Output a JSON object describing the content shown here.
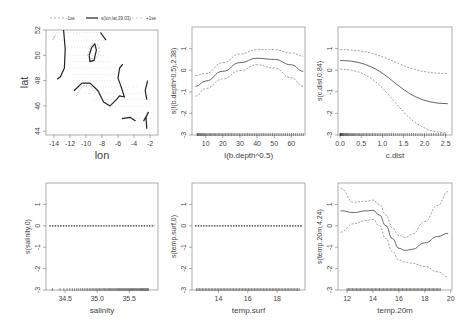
{
  "figure": {
    "layout": "2x3 grid of GAM partial-effect plots",
    "colors": {
      "fit": "#555555",
      "se": "#888888",
      "rug": "#222222",
      "frame": "#999999",
      "grid_points": "#aaaaaa"
    }
  },
  "chart_data": [
    {
      "type": "contour",
      "id": "lonlat",
      "title": "",
      "legend": [
        "-1se",
        "s(lon,lat,39.03)",
        "+1se"
      ],
      "xlabel": "lon",
      "ylabel": "lat",
      "xlim": [
        -15,
        -1
      ],
      "ylim": [
        43.7,
        52
      ],
      "xticks": [
        -14,
        -12,
        -10,
        -8,
        -6,
        -4,
        -2
      ],
      "yticks": [
        44,
        46,
        48,
        50,
        52
      ],
      "contours": [
        {
          "style": "solid",
          "points": [
            [
              -12.8,
              52
            ],
            [
              -12.6,
              50.5
            ],
            [
              -12.7,
              49
            ],
            [
              -13.2,
              48.3
            ],
            [
              -13.6,
              48.1
            ]
          ]
        },
        {
          "style": "solid",
          "points": [
            [
              -9.6,
              50.0
            ],
            [
              -9.3,
              50.6
            ],
            [
              -8.9,
              50.9
            ],
            [
              -8.7,
              50.4
            ],
            [
              -9.0,
              49.6
            ],
            [
              -9.5,
              49.5
            ],
            [
              -9.6,
              50.0
            ]
          ]
        },
        {
          "style": "solid",
          "points": [
            [
              -8.2,
              51.8
            ],
            [
              -7.5,
              51.2
            ]
          ]
        },
        {
          "style": "solid",
          "points": [
            [
              -11.5,
              47.2
            ],
            [
              -10.5,
              47.8
            ],
            [
              -9.5,
              47.8
            ],
            [
              -8.5,
              47.2
            ],
            [
              -7.8,
              46.3
            ],
            [
              -7,
              46.0
            ],
            [
              -6.2,
              46.5
            ],
            [
              -5.8,
              46.8
            ],
            [
              -5.2,
              46.7
            ],
            [
              -5.6,
              47.5
            ],
            [
              -6.0,
              48.2
            ],
            [
              -5.8,
              49.0
            ],
            [
              -5.4,
              49.3
            ]
          ]
        },
        {
          "style": "solid",
          "points": [
            [
              -2.3,
              48.0
            ],
            [
              -2.6,
              47.2
            ],
            [
              -2.4,
              46.5
            ]
          ]
        },
        {
          "style": "solid",
          "points": [
            [
              -5.5,
              45.0
            ],
            [
              -4.5,
              45.1
            ],
            [
              -3.8,
              44.8
            ]
          ]
        },
        {
          "style": "solid",
          "points": [
            [
              -2.8,
              44.8
            ],
            [
              -2.2,
              45.5
            ],
            [
              -2.5,
              45.1
            ],
            [
              -2.4,
              44.2
            ]
          ]
        }
      ]
    },
    {
      "type": "line",
      "id": "bdepth",
      "xlabel": "I(b.depth^0.5)",
      "ylabel": "s(I(b.depth^0.5),2.38)",
      "xlim": [
        2,
        68
      ],
      "ylim": [
        -3,
        2
      ],
      "xticks": [
        10,
        20,
        30,
        40,
        50,
        60
      ],
      "yticks": [
        -3,
        -2,
        -1,
        0,
        1
      ],
      "x": [
        4,
        10,
        20,
        30,
        40,
        50,
        60,
        67
      ],
      "series": [
        {
          "name": "fit",
          "values": [
            -0.75,
            -0.5,
            -0.05,
            0.35,
            0.55,
            0.5,
            0.25,
            -0.05
          ]
        },
        {
          "name": "upper",
          "values": [
            -0.25,
            -0.15,
            0.35,
            0.75,
            0.95,
            0.95,
            0.8,
            0.65
          ]
        },
        {
          "name": "lower",
          "values": [
            -1.2,
            -0.85,
            -0.4,
            -0.02,
            0.25,
            0.1,
            -0.35,
            -0.75
          ]
        }
      ]
    },
    {
      "type": "line",
      "id": "cdist",
      "xlabel": "c.dist",
      "ylabel": "s(c.dist,0.84)",
      "xlim": [
        -0.05,
        2.65
      ],
      "ylim": [
        -3,
        2
      ],
      "xticks": [
        0.0,
        0.5,
        1.0,
        1.5,
        2.0,
        2.5
      ],
      "yticks": [
        -3,
        -2,
        -1,
        0,
        1
      ],
      "x": [
        0.0,
        2.55
      ],
      "series": [
        {
          "name": "fit",
          "values": [
            0.45,
            -1.55
          ]
        },
        {
          "name": "upper",
          "values": [
            0.95,
            -0.15
          ]
        },
        {
          "name": "lower",
          "values": [
            0.05,
            -2.9
          ]
        }
      ]
    },
    {
      "type": "line",
      "id": "salinity",
      "xlabel": "salinity",
      "ylabel": "s(salinity,0)",
      "xlim": [
        34.2,
        35.95
      ],
      "ylim": [
        -3,
        2
      ],
      "xticks": [
        34.5,
        35.0,
        35.5
      ],
      "yticks": [
        -3,
        -2,
        -1,
        0,
        1
      ],
      "x": [
        34.25,
        35.9
      ],
      "series": [
        {
          "name": "fit",
          "values": [
            0,
            0
          ]
        }
      ]
    },
    {
      "type": "line",
      "id": "tempsurf",
      "xlabel": "temp.surf",
      "ylabel": "s(temp.surf,0)",
      "xlim": [
        12.2,
        19.9
      ],
      "ylim": [
        -3,
        2
      ],
      "xticks": [
        14,
        16,
        18
      ],
      "yticks": [
        -3,
        -2,
        -1,
        0,
        1
      ],
      "x": [
        12.4,
        19.7
      ],
      "series": [
        {
          "name": "fit",
          "values": [
            0,
            0
          ]
        }
      ]
    },
    {
      "type": "line",
      "id": "temp20m",
      "xlabel": "temp.20m",
      "ylabel": "s(temp.20m,4.24)",
      "xlim": [
        11.3,
        20.1
      ],
      "ylim": [
        -3,
        2
      ],
      "xticks": [
        12,
        14,
        16,
        18,
        20
      ],
      "yticks": [
        -3,
        -2,
        -1,
        0,
        1
      ],
      "x": [
        11.5,
        12.5,
        13.5,
        14.0,
        14.5,
        15.0,
        15.5,
        16.0,
        16.5,
        17.0,
        18.0,
        19.0,
        19.8
      ],
      "series": [
        {
          "name": "fit",
          "values": [
            0.7,
            0.62,
            0.7,
            0.72,
            0.5,
            0.0,
            -0.6,
            -1.05,
            -1.15,
            -1.1,
            -0.8,
            -0.5,
            -0.35
          ]
        },
        {
          "name": "upper",
          "values": [
            1.75,
            1.1,
            1.15,
            1.2,
            1.0,
            0.5,
            -0.1,
            -0.45,
            -0.55,
            -0.4,
            0.2,
            0.95,
            1.6
          ]
        },
        {
          "name": "lower",
          "values": [
            -0.3,
            0.1,
            0.25,
            0.3,
            0.0,
            -0.6,
            -1.2,
            -1.6,
            -1.7,
            -1.75,
            -1.9,
            -2.15,
            -2.4
          ]
        }
      ]
    }
  ]
}
